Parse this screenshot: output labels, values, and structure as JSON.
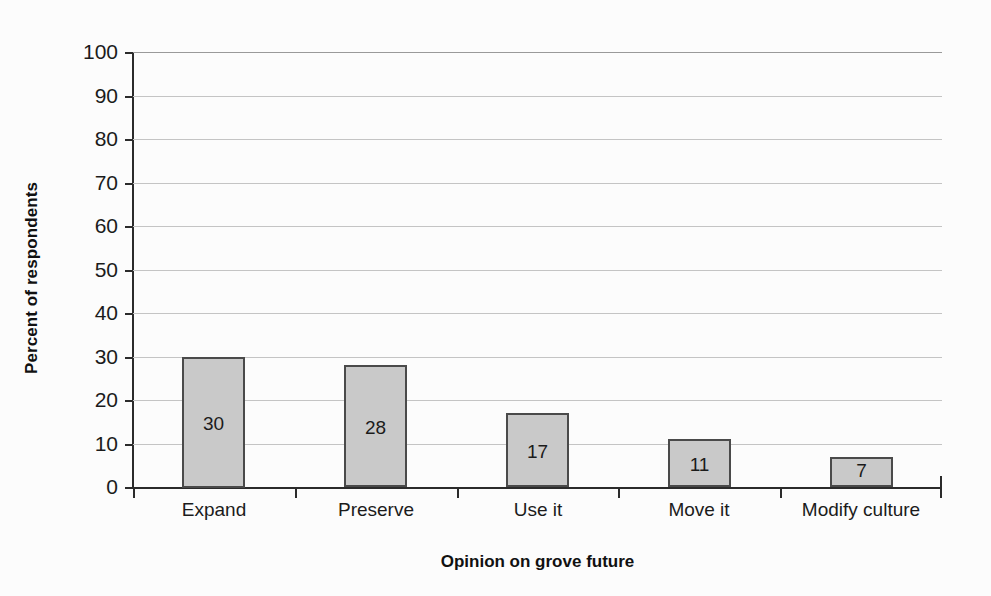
{
  "chart_data": {
    "type": "bar",
    "title": "",
    "xlabel": "Opinion on grove future",
    "ylabel": "Percent of respondents",
    "categories": [
      "Expand",
      "Preserve",
      "Use it",
      "Move it",
      "Modify culture"
    ],
    "values": [
      30,
      28,
      17,
      11,
      7
    ],
    "data_labels": [
      "30",
      "28",
      "17",
      "11",
      "7"
    ],
    "ylim": [
      0,
      100
    ],
    "ytick_labels": [
      "0",
      "10",
      "20",
      "30",
      "40",
      "50",
      "60",
      "70",
      "80",
      "90",
      "100"
    ],
    "ytick_values": [
      0,
      10,
      20,
      30,
      40,
      50,
      60,
      70,
      80,
      90,
      100
    ],
    "grid": true,
    "legend": false,
    "bar_fill_color": "#c9c9c9",
    "bar_border_color": "#4a4a4a",
    "gridline_color": "#c4c4c4",
    "axis_color": "#2b2b2b",
    "background_color": "#fcfcfc"
  }
}
